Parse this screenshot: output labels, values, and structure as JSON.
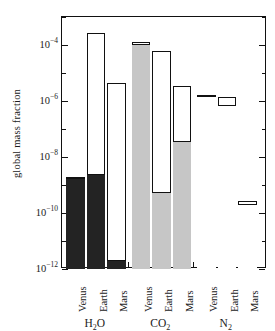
{
  "chart_data": {
    "type": "bar",
    "title": "",
    "xlabel": "",
    "ylabel": "global mass fraction",
    "scale": "log",
    "ylim": [
      1e-12,
      0.001
    ],
    "grid": false,
    "legend": null,
    "ytick_labels": [
      "10",
      "10",
      "10",
      "10",
      "10"
    ],
    "ytick_exponents": [
      "−4",
      "−6",
      "−8",
      "−10",
      "−12"
    ],
    "ytick_values": [
      0.0001,
      1e-06,
      1e-08,
      1e-10,
      1e-12
    ],
    "groups": [
      {
        "name": "H2O",
        "label_main": "H",
        "label_sub": "2",
        "label_tail": "O",
        "fill": "#232323",
        "fill_name": "black",
        "categories": [
          "Venus",
          "Earth",
          "Mars"
        ],
        "bars": [
          {
            "category": "Venus",
            "filled_top": 1.6e-09,
            "total_top": 2e-09
          },
          {
            "category": "Earth",
            "filled_top": 2.3e-09,
            "total_top": 0.00027
          },
          {
            "category": "Mars",
            "filled_top": 2e-12,
            "total_top": 4.5e-06
          }
        ]
      },
      {
        "name": "CO2",
        "label_main": "CO",
        "label_sub": "2",
        "label_tail": "",
        "fill": "#c6c6c6",
        "fill_name": "gray",
        "categories": [
          "Venus",
          "Earth",
          "Mars"
        ],
        "bars": [
          {
            "category": "Venus",
            "filled_top": 0.0001,
            "total_top": 0.00013
          },
          {
            "category": "Earth",
            "filled_top": 5e-10,
            "total_top": 6e-05
          },
          {
            "category": "Mars",
            "filled_top": 3.5e-08,
            "total_top": 3.5e-06
          }
        ]
      },
      {
        "name": "N2",
        "label_main": "N",
        "label_sub": "2",
        "label_tail": "",
        "fill": "#ffffff",
        "fill_name": "white",
        "categories": [
          "Venus",
          "Earth",
          "Mars"
        ],
        "bars": [
          {
            "category": "Venus",
            "filled_top": 1.4e-06,
            "total_top": 1.7e-06
          },
          {
            "category": "Earth",
            "filled_top": 6.5e-07,
            "total_top": 1.4e-06
          },
          {
            "category": "Mars",
            "filled_top": 2e-10,
            "total_top": 2.6e-10
          }
        ]
      }
    ]
  }
}
